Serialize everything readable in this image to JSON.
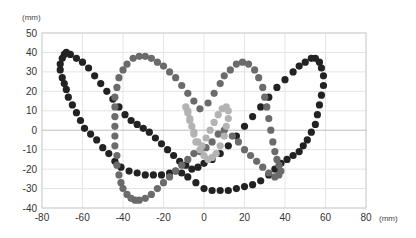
{
  "chart_data": {
    "type": "scatter",
    "title": "",
    "xlabel": "(mm)",
    "ylabel": "(mm)",
    "xlim": [
      -80,
      80
    ],
    "ylim": [
      -40,
      50
    ],
    "x_ticks": [
      -80,
      -60,
      -40,
      -20,
      0,
      20,
      40,
      60,
      80
    ],
    "y_ticks": [
      -40,
      -30,
      -20,
      -10,
      0,
      10,
      20,
      30,
      40,
      50
    ],
    "x_tick_labels": [
      "-80",
      "-60",
      "-40",
      "-20",
      "0",
      "20",
      "40",
      "60",
      "80"
    ],
    "y_tick_labels": [
      "-40",
      "-30",
      "-20",
      "-10",
      "0",
      "10",
      "20",
      "30",
      "40",
      "50"
    ],
    "grid": true,
    "legend": null,
    "series": [
      {
        "name": "black",
        "color": "#222222",
        "marker_size": 3.6,
        "points": [
          [
            -69,
            39
          ],
          [
            -68,
            40
          ],
          [
            -66,
            39
          ],
          [
            -63,
            37
          ],
          [
            -60,
            35
          ],
          [
            -57,
            32
          ],
          [
            -54,
            28
          ],
          [
            -51,
            24
          ],
          [
            -48,
            20
          ],
          [
            -45,
            16
          ],
          [
            -42,
            12
          ],
          [
            -39,
            8
          ],
          [
            -36,
            5
          ],
          [
            -33,
            3
          ],
          [
            -30,
            1
          ],
          [
            -27,
            -1
          ],
          [
            -24,
            -4
          ],
          [
            -21,
            -7
          ],
          [
            -18,
            -10
          ],
          [
            -15,
            -13
          ],
          [
            -12,
            -16
          ],
          [
            -9,
            -18
          ],
          [
            -6,
            -20
          ],
          [
            -70,
            37
          ],
          [
            -71,
            34
          ],
          [
            -71,
            31
          ],
          [
            -70,
            27
          ],
          [
            -69,
            24
          ],
          [
            -68,
            21
          ],
          [
            -67,
            17
          ],
          [
            -65,
            13
          ],
          [
            -63,
            9
          ],
          [
            -61,
            5
          ],
          [
            -59,
            1
          ],
          [
            -56,
            -2
          ],
          [
            -53,
            -5
          ],
          [
            -50,
            -9
          ],
          [
            -47,
            -12
          ],
          [
            -44,
            -16
          ],
          [
            -41,
            -19
          ],
          [
            -37,
            -21
          ],
          [
            -33,
            -22
          ],
          [
            -29,
            -23
          ],
          [
            -25,
            -23
          ],
          [
            -21,
            -23
          ],
          [
            -17,
            -22
          ],
          [
            -14,
            -21
          ],
          [
            -11,
            -22
          ],
          [
            -8,
            -24
          ],
          [
            -4,
            -27
          ],
          [
            0,
            -30
          ],
          [
            4,
            -31
          ],
          [
            8,
            -31
          ],
          [
            12,
            -31
          ],
          [
            16,
            -30
          ],
          [
            20,
            -29
          ],
          [
            24,
            -28
          ],
          [
            28,
            -26
          ],
          [
            32,
            -23
          ],
          [
            35,
            -20
          ],
          [
            38,
            -17
          ],
          [
            41,
            -15
          ],
          [
            44,
            -13
          ],
          [
            47,
            -11
          ],
          [
            49,
            -8
          ],
          [
            51,
            -5
          ],
          [
            53,
            -1
          ],
          [
            55,
            3
          ],
          [
            56,
            8
          ],
          [
            57,
            13
          ],
          [
            58,
            18
          ],
          [
            59,
            23
          ],
          [
            59,
            28
          ],
          [
            58,
            32
          ],
          [
            57,
            35
          ],
          [
            55,
            37
          ],
          [
            53,
            37
          ],
          [
            50,
            35
          ],
          [
            47,
            33
          ],
          [
            44,
            30
          ],
          [
            40,
            26
          ],
          [
            36,
            22
          ],
          [
            32,
            17
          ],
          [
            28,
            12
          ],
          [
            24,
            7
          ],
          [
            20,
            2
          ],
          [
            16,
            -3
          ],
          [
            12,
            -8
          ],
          [
            8,
            -12
          ],
          [
            4,
            -15
          ],
          [
            0,
            -17
          ],
          [
            -3,
            -19
          ]
        ]
      },
      {
        "name": "dark-gray",
        "color": "#6b6b6b",
        "marker_size": 3.6,
        "points": [
          [
            -34,
            -36
          ],
          [
            -36,
            -35
          ],
          [
            -38,
            -33
          ],
          [
            -40,
            -30
          ],
          [
            -41,
            -27
          ],
          [
            -42,
            -23
          ],
          [
            -43,
            -18
          ],
          [
            -43,
            -13
          ],
          [
            -44,
            -8
          ],
          [
            -44,
            -3
          ],
          [
            -44,
            2
          ],
          [
            -44,
            7
          ],
          [
            -44,
            12
          ],
          [
            -44,
            17
          ],
          [
            -43,
            22
          ],
          [
            -42,
            27
          ],
          [
            -40,
            31
          ],
          [
            -38,
            34
          ],
          [
            -35,
            37
          ],
          [
            -32,
            38
          ],
          [
            -29,
            38
          ],
          [
            -26,
            37
          ],
          [
            -23,
            35
          ],
          [
            -20,
            33
          ],
          [
            -17,
            30
          ],
          [
            -14,
            27
          ],
          [
            -11,
            23
          ],
          [
            -8,
            19
          ],
          [
            -5,
            15
          ],
          [
            -2,
            11
          ],
          [
            2,
            14
          ],
          [
            5,
            19
          ],
          [
            8,
            24
          ],
          [
            10,
            28
          ],
          [
            13,
            31
          ],
          [
            16,
            34
          ],
          [
            19,
            35
          ],
          [
            22,
            34
          ],
          [
            25,
            31
          ],
          [
            27,
            27
          ],
          [
            29,
            22
          ],
          [
            30,
            17
          ],
          [
            31,
            12
          ],
          [
            32,
            6
          ],
          [
            33,
            0
          ],
          [
            34,
            -6
          ],
          [
            35,
            -11
          ],
          [
            36,
            -15
          ],
          [
            37,
            -18
          ],
          [
            38,
            -21
          ],
          [
            37,
            -23
          ],
          [
            35,
            -24
          ],
          [
            32,
            -22
          ],
          [
            29,
            -19
          ],
          [
            26,
            -16
          ],
          [
            23,
            -13
          ],
          [
            20,
            -10
          ],
          [
            17,
            -6
          ],
          [
            14,
            -3
          ],
          [
            10,
            0
          ],
          [
            7,
            -2
          ],
          [
            4,
            -6
          ],
          [
            1,
            -9
          ],
          [
            -2,
            -11
          ],
          [
            -5,
            -12
          ],
          [
            -8,
            -15
          ],
          [
            -11,
            -18
          ],
          [
            -14,
            -21
          ],
          [
            -17,
            -24
          ],
          [
            -20,
            -27
          ],
          [
            -23,
            -30
          ],
          [
            -26,
            -33
          ],
          [
            -29,
            -35
          ],
          [
            -32,
            -36
          ]
        ]
      },
      {
        "name": "light-gray",
        "color": "#b3b3b3",
        "marker_size": 3.6,
        "points": [
          [
            -8,
            10
          ],
          [
            -7,
            6
          ],
          [
            -6,
            2
          ],
          [
            -5,
            -2
          ],
          [
            -4,
            -6
          ],
          [
            -2,
            -10
          ],
          [
            0,
            -13
          ],
          [
            2,
            -15
          ],
          [
            4,
            -14
          ],
          [
            6,
            -12
          ],
          [
            8,
            -8
          ],
          [
            10,
            -3
          ],
          [
            11,
            2
          ],
          [
            12,
            6
          ],
          [
            12,
            10
          ],
          [
            11,
            12
          ],
          [
            9,
            11
          ],
          [
            7,
            8
          ],
          [
            5,
            4
          ],
          [
            3,
            0
          ],
          [
            1,
            -4
          ],
          [
            -1,
            -8
          ],
          [
            -3,
            -6
          ],
          [
            -5,
            -1
          ],
          [
            -7,
            5
          ],
          [
            -8,
            9
          ],
          [
            -9,
            12
          ]
        ]
      }
    ]
  }
}
